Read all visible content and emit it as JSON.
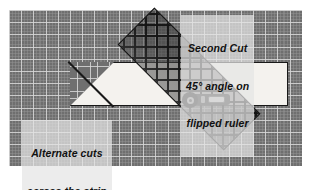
{
  "scene": {
    "title": "Rotary cutting diagram: second 45-degree cut on a fabric strip",
    "mat": {
      "name": "self-healing cutting mat",
      "color": "#6f6f6f",
      "grid_line_color": "#d7d7d7",
      "major_grid_spacing_px": 12,
      "minor_grid_spacing_px": 3
    },
    "fabric": {
      "name": "fabric strip",
      "color": "#f4f2ee",
      "outline_color": "#191919"
    },
    "ruler": {
      "name": "quilting ruler",
      "angle_label": "45°",
      "fill_color": "#3c3c3c",
      "lattice_color": "#141414"
    },
    "cutter": {
      "name": "rotary cutter",
      "blade_color": "#1a1a1a",
      "body_color": "#2b2b2b",
      "grip_color": "#b9b9b9"
    }
  },
  "labels": {
    "second_cut": {
      "line1": "Second Cut",
      "line2": "45° angle on",
      "line3": "flipped ruler"
    },
    "alternate": {
      "line1": "Alternate cuts",
      "line2": "across the strip"
    }
  }
}
